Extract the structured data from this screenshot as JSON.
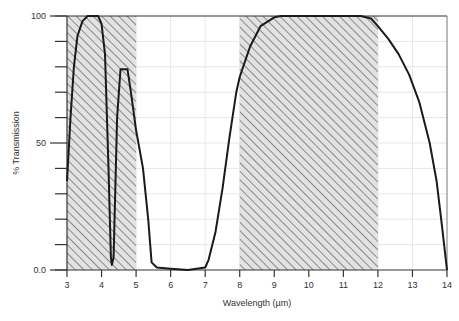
{
  "chart_data": {
    "type": "line",
    "title": "",
    "xlabel": "Wavelength  (µm)",
    "ylabel": "% Transmission",
    "xlim": [
      3,
      14
    ],
    "ylim": [
      0,
      100
    ],
    "x_ticks": [
      3,
      4,
      5,
      6,
      7,
      8,
      9,
      10,
      11,
      12,
      13,
      14
    ],
    "y_tick_labels": [
      {
        "value": 100,
        "label": "100"
      },
      {
        "value": 50,
        "label": "50"
      },
      {
        "value": 0,
        "label": "0.0"
      }
    ],
    "y_minor_ticks": [
      10,
      20,
      30,
      40,
      60,
      70,
      80,
      90
    ],
    "grid": true,
    "legend": null,
    "shaded_regions": [
      {
        "x_start": 3,
        "x_end": 5,
        "pattern": "diagonal-hatch",
        "label": "atmospheric window 3-5 µm"
      },
      {
        "x_start": 8,
        "x_end": 12,
        "pattern": "diagonal-hatch",
        "label": "atmospheric window 8-12 µm"
      }
    ],
    "series": [
      {
        "name": "Transmission",
        "x": [
          3.0,
          3.1,
          3.2,
          3.3,
          3.45,
          3.6,
          3.9,
          4.0,
          4.1,
          4.2,
          4.27,
          4.3,
          4.35,
          4.45,
          4.55,
          4.75,
          4.85,
          5.0,
          5.2,
          5.35,
          5.45,
          5.6,
          6.0,
          6.5,
          7.0,
          7.1,
          7.3,
          7.5,
          7.7,
          7.9,
          8.0,
          8.3,
          8.6,
          9.0,
          9.2,
          11.5,
          11.8,
          12.0,
          12.3,
          12.6,
          12.9,
          13.2,
          13.5,
          13.7,
          13.85,
          14.0
        ],
        "y": [
          35,
          60,
          80,
          92,
          98,
          100,
          100,
          97,
          85,
          40,
          5,
          2,
          5,
          60,
          79,
          79,
          70,
          55,
          40,
          20,
          3,
          1,
          0.5,
          0,
          1,
          4,
          15,
          32,
          52,
          70,
          76,
          88,
          96,
          99.5,
          100,
          100,
          99,
          96,
          91,
          85,
          77,
          66,
          50,
          35,
          18,
          0
        ]
      }
    ]
  },
  "colors": {
    "curve": "#1a1a1a",
    "hatch_line": "#8a8a8a",
    "hatch_bg": "#e2e2e2",
    "grid": "#e6e6e6",
    "axis": "#333333"
  }
}
